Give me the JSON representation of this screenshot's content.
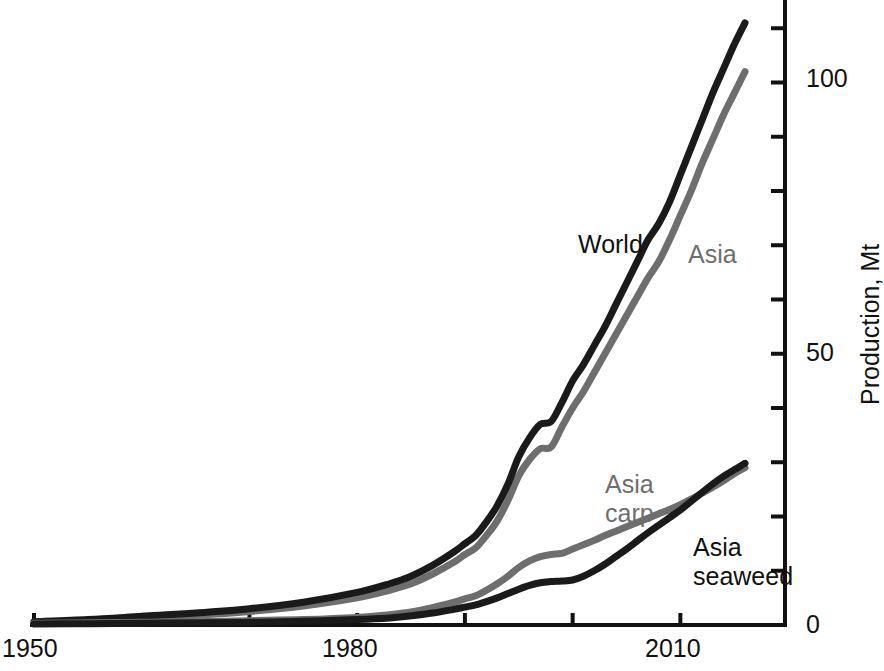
{
  "chart_data": {
    "type": "line",
    "title": "",
    "subtitle": "",
    "xlabel": "",
    "ylabel": "Production, Mt",
    "xlim": [
      1950,
      2018
    ],
    "ylim": [
      0,
      113
    ],
    "grid": false,
    "legend_position": "inline-annotations",
    "x_ticks": [
      1950,
      1960,
      1970,
      1980,
      1990,
      2000,
      2010
    ],
    "x_tick_labels": [
      "1950",
      "",
      "",
      "1980",
      "",
      "",
      "2010"
    ],
    "y_ticks": [
      0,
      10,
      20,
      30,
      40,
      50,
      60,
      70,
      80,
      90,
      100,
      110
    ],
    "y_tick_labels": [
      "0",
      "",
      "",
      "",
      "",
      "50",
      "",
      "",
      "",
      "",
      "100",
      ""
    ],
    "y_axis_side": "right",
    "x": [
      1950,
      1955,
      1960,
      1965,
      1970,
      1975,
      1980,
      1983,
      1985,
      1987,
      1989,
      1990,
      1991,
      1992,
      1993,
      1994,
      1995,
      1996,
      1997,
      1998,
      1999,
      2000,
      2001,
      2002,
      2003,
      2004,
      2005,
      2006,
      2007,
      2008,
      2009,
      2010,
      2011,
      2012,
      2013,
      2014,
      2015,
      2016
    ],
    "series": [
      {
        "name": "World",
        "color": "#1a1a1a",
        "label_position": {
          "x": 578,
          "y": 230
        },
        "values": [
          0.6,
          1.0,
          1.6,
          2.2,
          3.0,
          4.2,
          6.0,
          7.6,
          9.0,
          11.0,
          13.5,
          15.0,
          16.5,
          19.0,
          22.0,
          26.0,
          31.0,
          34.5,
          37.0,
          37.5,
          41.0,
          45.0,
          48.0,
          51.5,
          55.0,
          59.0,
          63.0,
          67.0,
          71.0,
          74.0,
          78.0,
          83.0,
          88.0,
          93.0,
          98.0,
          102.5,
          107.0,
          111.0
        ]
      },
      {
        "name": "Asia",
        "color": "#6e6e6e",
        "label_position": {
          "x": 688,
          "y": 240
        },
        "values": [
          0.5,
          0.8,
          1.3,
          1.8,
          2.5,
          3.5,
          5.0,
          6.4,
          7.6,
          9.4,
          11.6,
          13.0,
          14.2,
          16.5,
          19.2,
          23.0,
          27.5,
          30.5,
          32.5,
          32.8,
          36.5,
          40.0,
          43.0,
          46.5,
          50.0,
          53.5,
          57.0,
          60.5,
          64.0,
          67.0,
          71.0,
          75.5,
          80.0,
          85.0,
          89.5,
          94.0,
          98.0,
          102.0
        ]
      },
      {
        "name": "Asia carp",
        "color": "#6e6e6e",
        "label_position": {
          "x": 605,
          "y": 470
        },
        "values": [
          0.3,
          0.4,
          0.5,
          0.6,
          0.8,
          1.0,
          1.4,
          1.9,
          2.4,
          3.2,
          4.2,
          4.8,
          5.4,
          6.4,
          7.6,
          9.0,
          10.6,
          11.8,
          12.6,
          13.0,
          13.2,
          14.0,
          14.8,
          15.6,
          16.5,
          17.3,
          18.1,
          18.9,
          19.7,
          20.5,
          21.3,
          22.2,
          23.2,
          24.3,
          25.4,
          26.6,
          27.9,
          29.0
        ]
      },
      {
        "name": "Asia seaweed",
        "color": "#1a1a1a",
        "label_position": {
          "x": 693,
          "y": 533
        },
        "values": [
          0.2,
          0.25,
          0.3,
          0.4,
          0.5,
          0.7,
          1.0,
          1.3,
          1.7,
          2.2,
          2.9,
          3.3,
          3.7,
          4.3,
          5.0,
          5.8,
          6.6,
          7.3,
          7.8,
          8.0,
          8.1,
          8.3,
          9.0,
          10.0,
          11.2,
          12.6,
          14.0,
          15.5,
          17.0,
          18.4,
          19.8,
          21.2,
          22.8,
          24.4,
          26.0,
          27.4,
          28.6,
          29.8
        ]
      }
    ]
  },
  "axis": {
    "y_title": "Production, Mt",
    "x_labels": [
      {
        "text": "1950",
        "x": 2,
        "y": 636
      },
      {
        "text": "1980",
        "x": 322,
        "y": 636
      },
      {
        "text": "2010",
        "x": 645,
        "y": 636
      }
    ],
    "y_labels": [
      {
        "text": "100",
        "x": 806,
        "y": 66
      },
      {
        "text": "50",
        "x": 806,
        "y": 340
      },
      {
        "text": "0",
        "x": 806,
        "y": 612
      }
    ]
  },
  "annotations": [
    {
      "name": "world-label",
      "text": "World",
      "color": "#1a1a1a"
    },
    {
      "name": "asia-label",
      "text": "Asia",
      "color": "#6e6e6e"
    },
    {
      "name": "asia-carp-label",
      "text": "Asia\ncarp",
      "line1": "Asia",
      "line2": "carp",
      "color": "#6e6e6e"
    },
    {
      "name": "asia-seaweed-label",
      "text": "Asia\nseaweed",
      "line1": "Asia",
      "line2": "seaweed",
      "color": "#1a1a1a"
    }
  ]
}
